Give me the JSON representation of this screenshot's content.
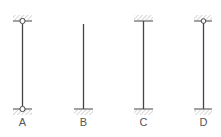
{
  "diagram": {
    "title": "",
    "columns": [
      {
        "label": "A",
        "top_support": "pinned",
        "bottom_support": "pinned"
      },
      {
        "label": "B",
        "top_support": "free",
        "bottom_support": "fixed"
      },
      {
        "label": "C",
        "top_support": "fixed",
        "bottom_support": "fixed"
      },
      {
        "label": "D",
        "top_support": "pinned",
        "bottom_support": "fixed"
      }
    ],
    "colors": {
      "line": "#444444",
      "hatch": "#aaaaaa",
      "label": "#555555"
    }
  }
}
